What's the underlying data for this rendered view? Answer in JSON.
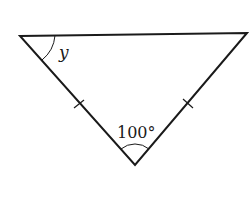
{
  "diagram": {
    "type": "isosceles-triangle",
    "vertices": {
      "top_left": [
        20,
        36
      ],
      "top_right": [
        247,
        33
      ],
      "bottom": [
        135,
        165
      ]
    },
    "angles": {
      "top_left_label": "y",
      "bottom_label": "100°"
    },
    "tick_marks": "equal sides (left and right legs)",
    "colors": {
      "stroke": "#1a1a1a",
      "background": "#ffffff"
    }
  }
}
